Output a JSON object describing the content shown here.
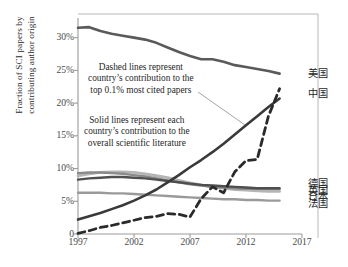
{
  "chart_data": {
    "type": "line",
    "title": "",
    "xlabel": "",
    "ylabel": "Fraction of SCI papers by contributing author origin",
    "ylabel_line1": "Fraction of SCI papers by",
    "ylabel_line2": "contributing author origin",
    "xlim": [
      1997,
      2017
    ],
    "ylim": [
      0,
      33
    ],
    "grid": false,
    "legend_position": "right",
    "xticks": [
      "1997",
      "2002",
      "2007",
      "2012",
      "2017"
    ],
    "xtick_values": [
      1997,
      2002,
      2007,
      2012,
      2017
    ],
    "yticks": [
      "0",
      "5%",
      "10%",
      "15%",
      "20%",
      "25%",
      "30%"
    ],
    "ytick_values": [
      0,
      5,
      10,
      15,
      20,
      25,
      30
    ],
    "x": [
      1997,
      1998,
      1999,
      2000,
      2001,
      2002,
      2003,
      2004,
      2005,
      2006,
      2007,
      2008,
      2009,
      2010,
      2011,
      2012,
      2013,
      2014,
      2015
    ],
    "series": [
      {
        "name": "united-states-overall",
        "label": "美国",
        "style": "solid",
        "color": "#5a5a5a",
        "width": 2.6,
        "values": [
          31.5,
          31.6,
          31.0,
          30.6,
          30.3,
          30.0,
          29.7,
          29.2,
          28.5,
          27.8,
          27.2,
          26.7,
          26.7,
          26.3,
          25.8,
          25.5,
          25.2,
          24.9,
          24.5
        ]
      },
      {
        "name": "china-overall",
        "label": "中国",
        "style": "solid",
        "color": "#3a3a3a",
        "width": 2.6,
        "values": [
          2.2,
          2.7,
          3.2,
          3.8,
          4.4,
          5.1,
          5.9,
          6.8,
          7.9,
          9.0,
          10.2,
          11.3,
          12.5,
          13.8,
          15.2,
          16.6,
          18.0,
          19.4,
          20.7
        ]
      },
      {
        "name": "china-top-cited",
        "label": "中国",
        "style": "dashed",
        "color": "#2a2a2a",
        "width": 2.8,
        "values": [
          0.1,
          0.5,
          1.0,
          1.3,
          1.7,
          2.1,
          2.5,
          2.7,
          3.1,
          3.0,
          2.6,
          5.4,
          7.2,
          6.3,
          9.5,
          11.2,
          11.4,
          18.0,
          22.2
        ]
      },
      {
        "name": "germany-overall",
        "label": "德国",
        "style": "solid",
        "color": "#4f4f4f",
        "width": 2.4,
        "values": [
          8.3,
          8.5,
          8.6,
          8.7,
          8.7,
          8.6,
          8.5,
          8.3,
          8.1,
          7.9,
          7.7,
          7.5,
          7.4,
          7.3,
          7.2,
          7.1,
          7.0,
          7.0,
          7.0
        ]
      },
      {
        "name": "united-kingdom-overall",
        "label": "英国",
        "style": "solid",
        "color": "#8a8a8a",
        "width": 2.4,
        "values": [
          9.3,
          9.4,
          9.4,
          9.3,
          9.2,
          9.0,
          8.8,
          8.5,
          8.2,
          7.9,
          7.6,
          7.4,
          7.2,
          7.1,
          7.0,
          6.9,
          6.9,
          6.9,
          6.9
        ]
      },
      {
        "name": "japan-overall",
        "label": "日本",
        "style": "solid",
        "color": "#b5b5b5",
        "width": 2.8,
        "values": [
          8.9,
          9.2,
          9.4,
          9.5,
          9.5,
          9.4,
          9.2,
          8.9,
          8.6,
          8.2,
          7.8,
          7.5,
          7.2,
          7.0,
          6.8,
          6.7,
          6.6,
          6.5,
          6.5
        ]
      },
      {
        "name": "france-overall",
        "label": "法国",
        "style": "solid",
        "color": "#9a9a9a",
        "width": 2.4,
        "values": [
          6.3,
          6.3,
          6.3,
          6.2,
          6.2,
          6.1,
          6.0,
          5.9,
          5.8,
          5.7,
          5.6,
          5.5,
          5.4,
          5.3,
          5.3,
          5.2,
          5.2,
          5.1,
          5.1
        ]
      }
    ],
    "annotations": [
      {
        "name": "dashed-lines-note",
        "lines": [
          "Dashed lines represent",
          "country’s contribution to the",
          "top 0.1% most cited papers"
        ],
        "leader_to": "china-top-cited"
      },
      {
        "name": "solid-lines-note",
        "lines": [
          "Solid lines represent each",
          "country’s contribution to the",
          "overall scientific literature"
        ],
        "leader_to": ""
      }
    ],
    "legend_entries": [
      {
        "name": "legend-united-states",
        "label": "美国",
        "y_value": 24.5
      },
      {
        "name": "legend-china",
        "label": "中国",
        "y_value": 21.4
      },
      {
        "name": "legend-germany",
        "label": "德国",
        "y_value": 7.6
      },
      {
        "name": "legend-united-kingdom",
        "label": "英国",
        "y_value": 6.6
      },
      {
        "name": "legend-japan",
        "label": "日本",
        "y_value": 5.6
      },
      {
        "name": "legend-france",
        "label": "法国",
        "y_value": 4.6
      }
    ]
  },
  "caption": {
    "text": ""
  }
}
